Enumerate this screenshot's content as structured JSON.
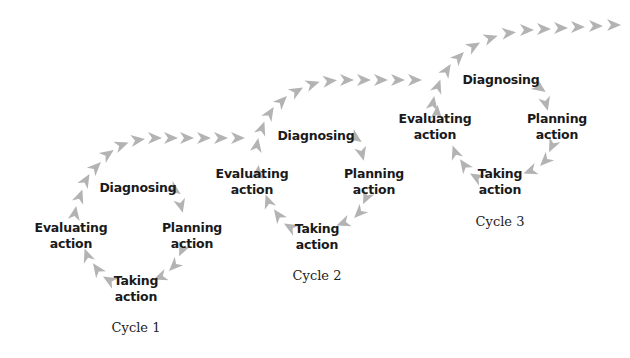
{
  "diagram": {
    "arrow_color": "#b3b3b3",
    "text_color": "#1a1a1a",
    "cycles": [
      {
        "caption": "Cycle 1",
        "steps": {
          "diagnosing": "Diagnosing",
          "planning_1": "Planning",
          "planning_2": "action",
          "taking_1": "Taking",
          "taking_2": "action",
          "evaluating_1": "Evaluating",
          "evaluating_2": "action"
        }
      },
      {
        "caption": "Cycle 2",
        "steps": {
          "diagnosing": "Diagnosing",
          "planning_1": "Planning",
          "planning_2": "action",
          "taking_1": "Taking",
          "taking_2": "action",
          "evaluating_1": "Evaluating",
          "evaluating_2": "action"
        }
      },
      {
        "caption": "Cycle 3",
        "steps": {
          "diagnosing": "Diagnosing",
          "planning_1": "Planning",
          "planning_2": "action",
          "taking_1": "Taking",
          "taking_2": "action",
          "evaluating_1": "Evaluating",
          "evaluating_2": "action"
        }
      }
    ]
  }
}
